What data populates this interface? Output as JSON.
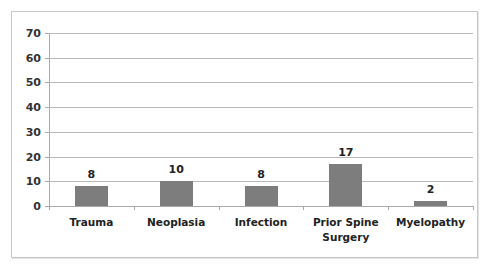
{
  "chart_data": {
    "type": "bar",
    "title": "",
    "xlabel": "",
    "ylabel": "",
    "categories": [
      "Trauma",
      "Neoplasia",
      "Infection",
      "Prior Spine Surgery",
      "Myelopathy"
    ],
    "category_lines": [
      [
        "Trauma"
      ],
      [
        "Neoplasia"
      ],
      [
        "Infection"
      ],
      [
        "Prior Spine",
        "Surgery"
      ],
      [
        "Myelopathy"
      ]
    ],
    "values": [
      8,
      10,
      8,
      17,
      2
    ],
    "value_labels": [
      "8",
      "10",
      "8",
      "17",
      "2"
    ],
    "ylim": [
      0,
      70
    ],
    "yticks": [
      0,
      10,
      20,
      30,
      40,
      50,
      60,
      70
    ],
    "ytick_labels": [
      "0",
      "10",
      "20",
      "30",
      "40",
      "50",
      "60",
      "70"
    ],
    "grid": true,
    "legend": null,
    "bar_color": "#7d7d7d"
  }
}
